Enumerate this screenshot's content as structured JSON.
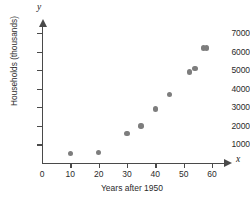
{
  "chart_data": {
    "type": "scatter",
    "title": "",
    "xlabel": "Years after 1950",
    "ylabel": "Households (thousands)",
    "x_axis_letter": "x",
    "y_axis_letter": "y",
    "xlim": [
      0,
      60
    ],
    "ylim": [
      0,
      7000
    ],
    "xticks": [
      0,
      10,
      20,
      30,
      40,
      50,
      60
    ],
    "xtick_labels": [
      "0",
      "10",
      "20",
      "30",
      "40",
      "50",
      "60"
    ],
    "yticks": [
      1000,
      2000,
      3000,
      4000,
      5000,
      6000,
      7000
    ],
    "ytick_labels": [
      "1000",
      "2000",
      "3000",
      "4000",
      "5000",
      "6000",
      "7000"
    ],
    "grid": false,
    "legend": null,
    "marker_color": "#7d7d7d",
    "axis_color": "#4a4a4a",
    "points": [
      {
        "x": 10,
        "y": 500
      },
      {
        "x": 20,
        "y": 550
      },
      {
        "x": 30,
        "y": 1600
      },
      {
        "x": 35,
        "y": 2000
      },
      {
        "x": 40,
        "y": 2900
      },
      {
        "x": 45,
        "y": 3700
      },
      {
        "x": 52,
        "y": 4900
      },
      {
        "x": 54,
        "y": 5100
      },
      {
        "x": 57,
        "y": 6200
      },
      {
        "x": 58,
        "y": 6200
      }
    ]
  }
}
